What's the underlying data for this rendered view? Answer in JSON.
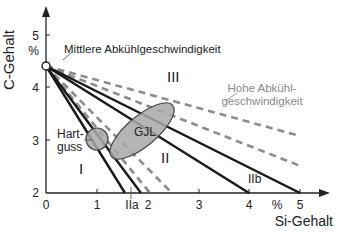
{
  "diagram": {
    "y_axis": {
      "title": "C-Gehalt",
      "unit": "%",
      "ticks": [
        "5",
        "4",
        "3",
        "2"
      ]
    },
    "x_axis": {
      "title": "Si-Gehalt",
      "unit": "%",
      "ticks": [
        "0",
        "1",
        "2",
        "3",
        "4",
        "5"
      ]
    },
    "labels": {
      "medium_cooling": "Mittlere Abkühlgeschwindigkeit",
      "high_cooling_1": "Hohe Abkühl-",
      "high_cooling_2": "geschwindigkeit",
      "region_1": "I",
      "region_2": "II",
      "region_3": "III",
      "region_2a": "IIa",
      "region_2b": "IIb",
      "hartguss_1": "Hart-",
      "hartguss_2": "guss",
      "gjl": "GJL"
    },
    "colors": {
      "solid": "#1a1a1a",
      "dashed": "#8c8c8c",
      "fill": "#a8a8a8",
      "gray_text": "#8a8a8a"
    }
  }
}
